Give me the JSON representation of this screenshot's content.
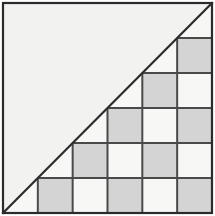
{
  "figure": {
    "type": "geometric-diagram",
    "canvas": {
      "width": 215,
      "height": 216
    },
    "square": {
      "x": 3,
      "y": 3,
      "width": 209,
      "height": 210,
      "fill": "#f2f2f0",
      "stroke": "#2b2b2b",
      "stroke_width": 2.2
    },
    "diagonal": {
      "description": "line from bottom-left corner to top-right corner of the square",
      "x1": 3,
      "y1": 213,
      "x2": 212,
      "y2": 3,
      "stroke": "#2b2b2b",
      "stroke_width": 2.2
    },
    "grid": {
      "columns": 6,
      "rows": 6,
      "cell_width": 34.83,
      "cell_height": 35.0,
      "origin_x": 3,
      "origin_y": 3,
      "line_stroke": "#4a4a4a",
      "line_width": 2.0
    },
    "colors": {
      "background": "#ffffff",
      "square_fill": "#f2f2f0",
      "cell_light": "#f7f7f6",
      "cell_shaded": "#d4d4d4",
      "triangle_wedge": "#d9d9d7",
      "border": "#2b2b2b",
      "grid_line": "#4a4a4a"
    },
    "cells": [
      {
        "row": 0,
        "col": 5,
        "shade": "light",
        "clipped": true
      },
      {
        "row": 1,
        "col": 4,
        "shade": "light",
        "clipped": true
      },
      {
        "row": 1,
        "col": 5,
        "shade": "shaded",
        "clipped": false
      },
      {
        "row": 2,
        "col": 3,
        "shade": "light",
        "clipped": true
      },
      {
        "row": 2,
        "col": 4,
        "shade": "shaded",
        "clipped": false
      },
      {
        "row": 2,
        "col": 5,
        "shade": "light",
        "clipped": false
      },
      {
        "row": 3,
        "col": 2,
        "shade": "light",
        "clipped": true
      },
      {
        "row": 3,
        "col": 3,
        "shade": "shaded",
        "clipped": false
      },
      {
        "row": 3,
        "col": 4,
        "shade": "light",
        "clipped": false
      },
      {
        "row": 3,
        "col": 5,
        "shade": "shaded",
        "clipped": false
      },
      {
        "row": 4,
        "col": 1,
        "shade": "light",
        "clipped": true
      },
      {
        "row": 4,
        "col": 2,
        "shade": "shaded",
        "clipped": false
      },
      {
        "row": 4,
        "col": 3,
        "shade": "light",
        "clipped": false
      },
      {
        "row": 4,
        "col": 4,
        "shade": "shaded",
        "clipped": false
      },
      {
        "row": 4,
        "col": 5,
        "shade": "light",
        "clipped": false
      },
      {
        "row": 5,
        "col": 0,
        "shade": "light",
        "clipped": true
      },
      {
        "row": 5,
        "col": 1,
        "shade": "shaded",
        "clipped": false
      },
      {
        "row": 5,
        "col": 2,
        "shade": "light",
        "clipped": false
      },
      {
        "row": 5,
        "col": 3,
        "shade": "shaded",
        "clipped": false
      },
      {
        "row": 5,
        "col": 4,
        "shade": "light",
        "clipped": false
      },
      {
        "row": 5,
        "col": 5,
        "shade": "shaded",
        "clipped": false
      }
    ]
  }
}
